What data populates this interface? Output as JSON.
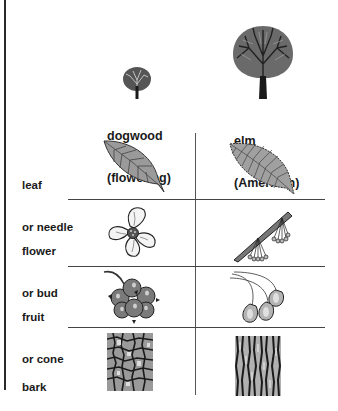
{
  "columns": [
    {
      "name": "dogwood",
      "label_line1": "dogwood",
      "label_line2": "(flowering)",
      "icon": "tree-small-icon"
    },
    {
      "name": "elm",
      "label_line1": "elm",
      "label_line2": "(American)",
      "icon": "tree-large-icon"
    }
  ],
  "rows": [
    {
      "label_line1": "leaf",
      "label_line2": "or needle",
      "cells": [
        "dogwood-leaf-icon",
        "elm-leaf-icon"
      ]
    },
    {
      "label_line1": "flower",
      "label_line2": "or bud",
      "cells": [
        "dogwood-flower-icon",
        "elm-flower-cluster-icon"
      ]
    },
    {
      "label_line1": "fruit",
      "label_line2": "or cone",
      "cells": [
        "dogwood-berry-cluster-icon",
        "elm-samara-icon"
      ]
    },
    {
      "label_line1": "bark",
      "label_line2": "",
      "cells": [
        "dogwood-bark-texture-icon",
        "elm-bark-texture-icon"
      ]
    }
  ],
  "colors": {
    "ink": "#1a1a1a",
    "leaf_fill": "#9a9a9a",
    "fruit_fill": "#7a7a7a",
    "line": "#444444"
  }
}
